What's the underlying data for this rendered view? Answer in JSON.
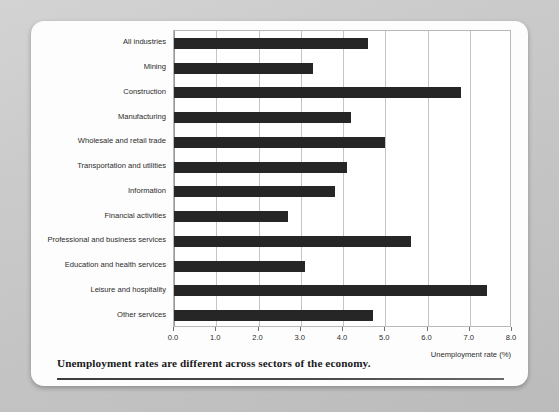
{
  "caption": "Unemployment rates are different across sectors of the economy.",
  "chart_data": {
    "type": "bar",
    "orientation": "horizontal",
    "title": "",
    "xlabel": "Unemployment rate (%)",
    "ylabel": "",
    "xlim": [
      0.0,
      8.0
    ],
    "xticks": [
      "0.0",
      "1.0",
      "2.0",
      "3.0",
      "4.0",
      "5.0",
      "6.0",
      "7.0",
      "8.0"
    ],
    "xtick_values": [
      0.0,
      1.0,
      2.0,
      3.0,
      4.0,
      5.0,
      6.0,
      7.0,
      8.0
    ],
    "grid": true,
    "legend": false,
    "bar_color": "#262626",
    "categories": [
      "All industries",
      "Mining",
      "Construction",
      "Manufacturing",
      "Wholesale and retail trade",
      "Transportation and utilities",
      "Information",
      "Financial activities",
      "Professional and business services",
      "Education and health services",
      "Leisure and hospitality",
      "Other services"
    ],
    "values": [
      4.6,
      3.3,
      6.8,
      4.2,
      5.0,
      4.1,
      3.8,
      2.7,
      5.6,
      3.1,
      7.4,
      4.7
    ]
  }
}
